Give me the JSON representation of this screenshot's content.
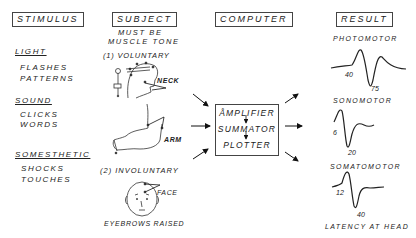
{
  "headers": {
    "stimulus": "STIMULUS",
    "subject": "SUBJECT",
    "computer": "COMPUTER",
    "result": "RESULT"
  },
  "stimulus": {
    "groups": [
      {
        "title": "LIGHT",
        "items": [
          "FLASHES",
          "PATTERNS"
        ]
      },
      {
        "title": "SOUND",
        "items": [
          "CLICKS",
          "WORDS"
        ]
      },
      {
        "title": "SOMESTHETIC",
        "items": [
          "SHOCKS",
          "TOUCHES"
        ]
      }
    ]
  },
  "subject": {
    "note_line1": "MUST BE",
    "note_line2": "MUSCLE TONE",
    "voluntary_label": "(1) VOLUNTARY",
    "neck_label": "NECK",
    "arm_label": "ARM",
    "involuntary_label": "(2) INVOLUNTARY",
    "face_label": "FACE",
    "face_caption": "EYEBROWS RAISED"
  },
  "computer": {
    "stages": [
      "ÅMPLIFIER",
      "SUMMATOR",
      "PLOTTER"
    ]
  },
  "result": {
    "traces": [
      {
        "title": "PHOTOMOTOR",
        "peak_label": "40",
        "trough_label": "75"
      },
      {
        "title": "SONOMOTOR",
        "peak_label": "6",
        "trough_label": "20"
      },
      {
        "title": "SOMATOMOTOR",
        "peak_label": "12",
        "trough_label": "40"
      }
    ],
    "footer": "LATENCY AT HEAD"
  }
}
